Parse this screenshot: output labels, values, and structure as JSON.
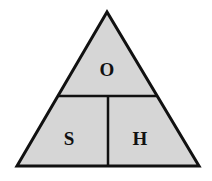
{
  "diagram": {
    "type": "formula-triangle",
    "colors": {
      "fill": "#d6d6d6",
      "stroke": "#111111",
      "background": "#ffffff"
    },
    "top": {
      "label": "O"
    },
    "bottom_left": {
      "label": "S"
    },
    "bottom_right": {
      "label": "H"
    }
  }
}
